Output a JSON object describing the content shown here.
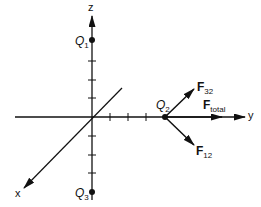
{
  "diagram": {
    "axes": {
      "x_label": "x",
      "y_label": "y",
      "z_label": "z"
    },
    "charges": [
      {
        "name": "Q",
        "sub": "1",
        "position": "on +z axis"
      },
      {
        "name": "Q",
        "sub": "2",
        "position": "on +y axis"
      },
      {
        "name": "Q",
        "sub": "3",
        "position": "on -z axis"
      }
    ],
    "forces": [
      {
        "name": "F",
        "sub": "32",
        "direction": "up-right from Q2"
      },
      {
        "name": "F",
        "sub": "total",
        "direction": "along +y from Q2"
      },
      {
        "name": "F",
        "sub": "12",
        "direction": "down-right from Q2"
      }
    ],
    "colors": {
      "line": "#111111",
      "background": "#ffffff"
    }
  }
}
